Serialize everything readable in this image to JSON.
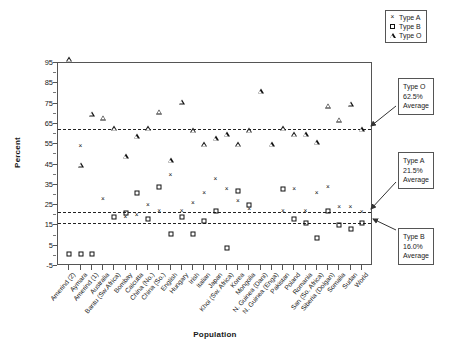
{
  "chart_data": {
    "type": "scatter",
    "title": "",
    "xlabel": "Population",
    "ylabel": "Percent",
    "ylim": [
      -5,
      95
    ],
    "yticks": [
      -5,
      5,
      15,
      25,
      35,
      45,
      55,
      65,
      75,
      85,
      95
    ],
    "grid": false,
    "legend_position": "top-right",
    "legend": [
      "Type A",
      "Type B",
      "Type O"
    ],
    "categories": [
      "Amerind (2)",
      "Aymara",
      "Amerind (1)",
      "Australia",
      "Bantu (Sw.Africa)",
      "Bombay",
      "Calcutta",
      "China (No.)",
      "China (So.)",
      "English",
      "Hungary",
      "Irish",
      "Italian",
      "Japan",
      "Khoi (Sw. Africa)",
      "Korea",
      "Mongolia",
      "N. Guinea (Dani)",
      "N. Guinea (Enga)",
      "Pakistan",
      "Poland",
      "Romania",
      "San (So. Africa)",
      "Siberia (Dolgan)",
      "Somalia",
      "Sudan",
      "World"
    ],
    "series": [
      {
        "name": "Type A",
        "marker": "x",
        "values": [
          0,
          54,
          0,
          28,
          0,
          19,
          20,
          25,
          22,
          40,
          22,
          26,
          31,
          38,
          33,
          27,
          23,
          0,
          0,
          22,
          33,
          22,
          31,
          34,
          24,
          24,
          21.5
        ]
      },
      {
        "name": "Type B",
        "marker": "square",
        "values": [
          1,
          1,
          1,
          0,
          19,
          21,
          31,
          18,
          34,
          11,
          19,
          11,
          17,
          22,
          4,
          32,
          25,
          0,
          0,
          33,
          18,
          16,
          9,
          22,
          15,
          13,
          16
        ]
      },
      {
        "name": "Type O",
        "marker": "triangle",
        "values": [
          97,
          45,
          70,
          68,
          63,
          49,
          59,
          63,
          71,
          47,
          76,
          62,
          55,
          58,
          60,
          55,
          62,
          81,
          55,
          63,
          60,
          60,
          56,
          74,
          67,
          75,
          62.5
        ]
      }
    ],
    "reference_lines": [
      {
        "label": "Type O Average",
        "value": 62.5
      },
      {
        "label": "Type A Average",
        "value": 21.5
      },
      {
        "label": "Type B Average",
        "value": 16.0
      }
    ]
  },
  "annotations": {
    "type_o": {
      "line1": "Type O",
      "line2": "62.5%",
      "line3": "Average"
    },
    "type_a": {
      "line1": "Type A",
      "line2": "21.5%",
      "line3": "Average"
    },
    "type_b": {
      "line1": "Type B",
      "line2": "16.0%",
      "line3": "Average"
    }
  }
}
